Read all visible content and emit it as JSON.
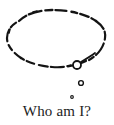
{
  "image": {
    "kind": "thought-bubble-illustration",
    "background_color": "#ffffff",
    "ink_color": "#141414",
    "width": 114,
    "height": 125
  },
  "caption": {
    "text": "Who am I?",
    "color": "#1d1d1d"
  },
  "bubble": {
    "shape": "ellipse",
    "stroke_style": "dashed-hand-drawn",
    "center_x": 56,
    "center_y": 37,
    "radius_x": 49,
    "radius_y": 26,
    "stroke_color": "#141414",
    "stroke_width": 2.1,
    "fill": "#ffffff"
  },
  "tail": {
    "count": 3,
    "circles": [
      {
        "name": "tail-circle-large",
        "cx": 77,
        "cy": 65,
        "r": 4.0,
        "stroke_width": 1.7
      },
      {
        "name": "tail-circle-medium",
        "cx": 81,
        "cy": 83,
        "r": 2.4,
        "stroke_width": 1.3
      },
      {
        "name": "tail-circle-small",
        "cx": 72,
        "cy": 97,
        "r": 1.3,
        "stroke_width": 1.0
      }
    ],
    "flick_stroke": {
      "from_x": 81,
      "from_y": 63,
      "to_x": 95,
      "to_y": 54
    }
  }
}
